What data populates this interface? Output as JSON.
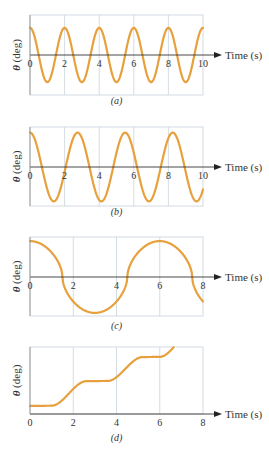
{
  "figure": {
    "curve_color": "#e7a03c",
    "grid_color": "#c9d3dc",
    "axis_color": "#333333"
  },
  "chart_data": [
    {
      "type": "line",
      "caption": "(a)",
      "xlabel": "Time (s)",
      "ylabel": "θ (deg)",
      "xticks": [
        "0",
        "2",
        "4",
        "6",
        "8",
        "10"
      ],
      "xlim": [
        0,
        10
      ],
      "function": "cosine",
      "period_s": 2.0,
      "amplitude_rel": 0.95,
      "ylim_rel": [
        -1.4,
        1.4
      ],
      "description": "Sinusoid starting at maximum, period 2 s, 5 full cycles"
    },
    {
      "type": "line",
      "caption": "(b)",
      "xlabel": "Time (s)",
      "ylabel": "θ (deg)",
      "xticks": [
        "0",
        "2",
        "4",
        "6",
        "8",
        "10"
      ],
      "xlim": [
        0,
        10
      ],
      "function": "cosine",
      "period_s": 2.75,
      "amplitude_rel": 1.0,
      "ylim_rel": [
        -1.15,
        1.15
      ],
      "description": "Sinusoid starting at maximum, period ~2.75 s, larger amplitude"
    },
    {
      "type": "line",
      "caption": "(c)",
      "xlabel": "Time (s)",
      "ylabel": "θ (deg)",
      "xticks": [
        "0",
        "2",
        "4",
        "6",
        "8"
      ],
      "xlim": [
        0,
        8
      ],
      "function": "flattened-cosine",
      "period_s": 6.0,
      "amplitude_rel": 1.0,
      "ylim_rel": [
        -1.1,
        1.1
      ],
      "description": "Non-sinusoidal (flat-topped) oscillation, period ~6 s, max at 0 and 6 s, min near 3 s"
    },
    {
      "type": "line",
      "caption": "(d)",
      "xlabel": "Time (s)",
      "ylabel": "θ (deg)",
      "xticks": [
        "0",
        "2",
        "4",
        "6",
        "8"
      ],
      "xlim": [
        0,
        8
      ],
      "function": "staircase",
      "description": "Monotonically increasing step-like curve: plateaus near t≈0–1, 2.5–3.5, 5–6; rising steps at ~2, ~4.5, ~6.8 s; exits top near 6.8 s"
    }
  ],
  "panels": [
    {
      "caption": "(a)",
      "xlabel": "Time (s)",
      "ylabel": "θ (deg)",
      "ticks": [
        "0",
        "2",
        "4",
        "6",
        "8",
        "10"
      ]
    },
    {
      "caption": "(b)",
      "xlabel": "Time (s)",
      "ylabel": "θ (deg)",
      "ticks": [
        "0",
        "2",
        "4",
        "6",
        "8",
        "10"
      ]
    },
    {
      "caption": "(c)",
      "xlabel": "Time (s)",
      "ylabel": "θ (deg)",
      "ticks": [
        "0",
        "2",
        "4",
        "6",
        "8"
      ]
    },
    {
      "caption": "(d)",
      "xlabel": "Time (s)",
      "ylabel": "θ (deg)",
      "ticks": [
        "0",
        "2",
        "4",
        "6",
        "8"
      ]
    }
  ]
}
